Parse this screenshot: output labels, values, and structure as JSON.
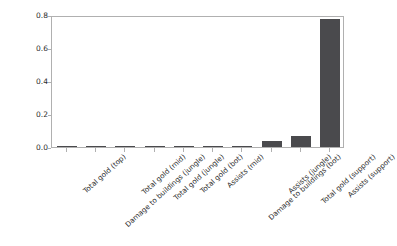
{
  "chart_data": {
    "type": "bar",
    "title": "",
    "xlabel": "",
    "ylabel": "",
    "ylim": [
      0.0,
      0.8
    ],
    "yticks": [
      "0.0",
      "0.2",
      "0.4",
      "0.6",
      "0.8"
    ],
    "ytick_values": [
      0.0,
      0.2,
      0.4,
      0.6,
      0.8
    ],
    "grid": false,
    "legend": null,
    "bar_color": "#4a4a4d",
    "categories": [
      "Total gold (top)",
      "Damage to buildings (jungle)",
      "Total gold (mid)",
      "Total gold (jungle)",
      "Total gold (bot)",
      "Assists (mid)",
      "Damage to buildings (bot)",
      "Assists (jungle)",
      "Total gold (support)",
      "Assists (support)"
    ],
    "values": [
      0.002,
      0.003,
      0.004,
      0.004,
      0.005,
      0.007,
      0.008,
      0.035,
      0.065,
      0.775
    ]
  },
  "figure": {
    "background": "#ffffff",
    "axes_color": "#b0b0b0",
    "text_color": "#2b2b2b"
  }
}
